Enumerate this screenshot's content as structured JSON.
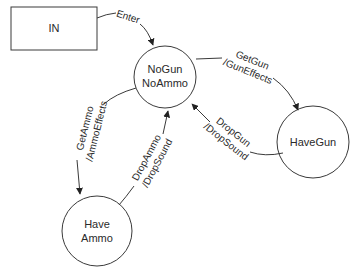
{
  "diagram": {
    "type": "state-machine",
    "nodes": {
      "in": {
        "label": "IN",
        "shape": "rectangle"
      },
      "nogun": {
        "line1": "NoGun",
        "line2": "NoAmmo",
        "shape": "circle"
      },
      "havegun": {
        "label": "HaveGun",
        "shape": "circle"
      },
      "haveammo": {
        "line1": "Have",
        "line2": "Ammo",
        "shape": "circle"
      }
    },
    "edges": {
      "enter": {
        "from": "IN",
        "to": "NoGun NoAmmo",
        "label": "Enter"
      },
      "getgun": {
        "from": "NoGun NoAmmo",
        "to": "HaveGun",
        "line1": "GetGun",
        "line2": "/GunEffects"
      },
      "dropgun": {
        "from": "HaveGun",
        "to": "NoGun NoAmmo",
        "line1": "DropGun",
        "line2": "/DropSound"
      },
      "getammo": {
        "from": "NoGun NoAmmo",
        "to": "Have Ammo",
        "line1": "GetAmmo",
        "line2": "/AmmoEffects"
      },
      "dropammo": {
        "from": "Have Ammo",
        "to": "NoGun NoAmmo",
        "line1": "DropAmmo",
        "line2": "/DropSound"
      }
    }
  }
}
